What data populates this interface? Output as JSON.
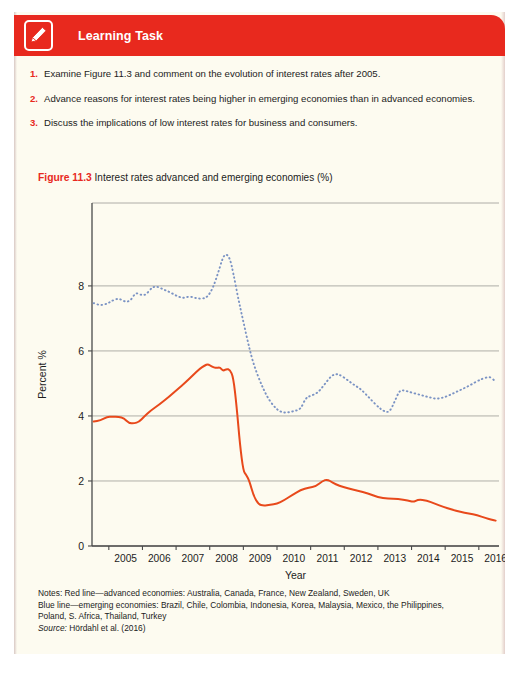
{
  "header": {
    "title": "Learning Task",
    "icon": "pencil-edit-icon",
    "accent_color": "#e8291e"
  },
  "tasks": [
    {
      "num": "1.",
      "text": "Examine Figure 11.3 and comment on the evolution of interest rates after 2005."
    },
    {
      "num": "2.",
      "text": "Advance reasons for interest rates being higher in emerging economies than in advanced economies."
    },
    {
      "num": "3.",
      "text": "Discuss the implications of low interest rates for business and consumers."
    }
  ],
  "figure": {
    "label": "Figure 11.3",
    "caption": "Interest rates advanced and emerging economies (%)"
  },
  "notes": {
    "line1": "Notes: Red line—advanced economies: Australia, Canada, France, New Zealand, Sweden, UK",
    "line2": "Blue line—emerging economies: Brazil, Chile, Colombia, Indonesia, Korea, Malaysia, Mexico, the Philippines,",
    "line3": "Poland, S. Africa, Thailand, Turkey",
    "source_label": "Source:",
    "source_text": " Hördahl et al. (2016)"
  },
  "chart_data": {
    "type": "line",
    "title": "Interest rates advanced and emerging economies (%)",
    "xlabel": "Year",
    "ylabel": "Percent %",
    "xlim": [
      2004.5,
      2016.6
    ],
    "ylim": [
      0,
      10.55
    ],
    "yticks": [
      0,
      2,
      4,
      6,
      8
    ],
    "xticks": [
      2005,
      2006,
      2007,
      2008,
      2009,
      2010,
      2011,
      2012,
      2013,
      2014,
      2015,
      2016
    ],
    "grid": "horizontal",
    "legend": "none",
    "colors": {
      "advanced": "#e8491b",
      "emerging": "#7b93c4"
    },
    "series": [
      {
        "name": "Red line—advanced economies",
        "style": "solid",
        "color": "#e8491b",
        "points": [
          [
            2004.55,
            3.83
          ],
          [
            2004.75,
            3.86
          ],
          [
            2004.95,
            3.97
          ],
          [
            2005.1,
            3.98
          ],
          [
            2005.3,
            3.97
          ],
          [
            2005.45,
            3.93
          ],
          [
            2005.6,
            3.78
          ],
          [
            2005.75,
            3.77
          ],
          [
            2005.9,
            3.82
          ],
          [
            2006.05,
            3.98
          ],
          [
            2006.25,
            4.17
          ],
          [
            2006.5,
            4.35
          ],
          [
            2006.8,
            4.6
          ],
          [
            2007.05,
            4.83
          ],
          [
            2007.3,
            5.05
          ],
          [
            2007.5,
            5.25
          ],
          [
            2007.7,
            5.45
          ],
          [
            2007.85,
            5.55
          ],
          [
            2007.95,
            5.6
          ],
          [
            2008.05,
            5.52
          ],
          [
            2008.2,
            5.47
          ],
          [
            2008.3,
            5.5
          ],
          [
            2008.4,
            5.38
          ],
          [
            2008.5,
            5.45
          ],
          [
            2008.6,
            5.42
          ],
          [
            2008.7,
            5.2
          ],
          [
            2008.8,
            4.3
          ],
          [
            2008.9,
            3.1
          ],
          [
            2009.0,
            2.3
          ],
          [
            2009.08,
            2.2
          ],
          [
            2009.18,
            2.0
          ],
          [
            2009.3,
            1.55
          ],
          [
            2009.45,
            1.28
          ],
          [
            2009.6,
            1.24
          ],
          [
            2009.8,
            1.27
          ],
          [
            2010.0,
            1.3
          ],
          [
            2010.2,
            1.4
          ],
          [
            2010.45,
            1.57
          ],
          [
            2010.7,
            1.72
          ],
          [
            2010.95,
            1.8
          ],
          [
            2011.15,
            1.83
          ],
          [
            2011.35,
            2.0
          ],
          [
            2011.5,
            2.05
          ],
          [
            2011.65,
            1.95
          ],
          [
            2011.85,
            1.85
          ],
          [
            2012.1,
            1.78
          ],
          [
            2012.4,
            1.7
          ],
          [
            2012.7,
            1.62
          ],
          [
            2013.0,
            1.5
          ],
          [
            2013.3,
            1.45
          ],
          [
            2013.6,
            1.45
          ],
          [
            2013.9,
            1.4
          ],
          [
            2014.05,
            1.35
          ],
          [
            2014.2,
            1.43
          ],
          [
            2014.45,
            1.4
          ],
          [
            2014.7,
            1.3
          ],
          [
            2014.95,
            1.2
          ],
          [
            2015.2,
            1.12
          ],
          [
            2015.45,
            1.05
          ],
          [
            2015.7,
            1.0
          ],
          [
            2015.95,
            0.95
          ],
          [
            2016.2,
            0.86
          ],
          [
            2016.4,
            0.8
          ],
          [
            2016.5,
            0.78
          ]
        ]
      },
      {
        "name": "Blue line—emerging economies",
        "style": "dotted",
        "color": "#7b93c4",
        "points": [
          [
            2004.55,
            7.47
          ],
          [
            2004.75,
            7.4
          ],
          [
            2004.95,
            7.45
          ],
          [
            2005.1,
            7.55
          ],
          [
            2005.3,
            7.62
          ],
          [
            2005.5,
            7.5
          ],
          [
            2005.65,
            7.55
          ],
          [
            2005.8,
            7.8
          ],
          [
            2005.95,
            7.72
          ],
          [
            2006.1,
            7.72
          ],
          [
            2006.25,
            7.92
          ],
          [
            2006.4,
            8.0
          ],
          [
            2006.6,
            7.9
          ],
          [
            2006.8,
            7.82
          ],
          [
            2007.0,
            7.7
          ],
          [
            2007.2,
            7.62
          ],
          [
            2007.4,
            7.68
          ],
          [
            2007.6,
            7.62
          ],
          [
            2007.8,
            7.6
          ],
          [
            2007.95,
            7.68
          ],
          [
            2008.1,
            7.95
          ],
          [
            2008.25,
            8.4
          ],
          [
            2008.38,
            8.85
          ],
          [
            2008.48,
            9.0
          ],
          [
            2008.6,
            8.85
          ],
          [
            2008.7,
            8.4
          ],
          [
            2008.85,
            7.6
          ],
          [
            2009.0,
            6.9
          ],
          [
            2009.15,
            6.2
          ],
          [
            2009.3,
            5.6
          ],
          [
            2009.5,
            5.05
          ],
          [
            2009.7,
            4.6
          ],
          [
            2009.9,
            4.3
          ],
          [
            2010.1,
            4.12
          ],
          [
            2010.3,
            4.1
          ],
          [
            2010.5,
            4.15
          ],
          [
            2010.7,
            4.2
          ],
          [
            2010.85,
            4.55
          ],
          [
            2011.0,
            4.62
          ],
          [
            2011.2,
            4.7
          ],
          [
            2011.4,
            4.95
          ],
          [
            2011.6,
            5.22
          ],
          [
            2011.75,
            5.3
          ],
          [
            2011.9,
            5.25
          ],
          [
            2012.1,
            5.1
          ],
          [
            2012.3,
            4.95
          ],
          [
            2012.5,
            4.82
          ],
          [
            2012.75,
            4.55
          ],
          [
            2013.0,
            4.28
          ],
          [
            2013.2,
            4.13
          ],
          [
            2013.35,
            4.12
          ],
          [
            2013.5,
            4.45
          ],
          [
            2013.65,
            4.8
          ],
          [
            2013.8,
            4.78
          ],
          [
            2014.0,
            4.72
          ],
          [
            2014.25,
            4.65
          ],
          [
            2014.5,
            4.58
          ],
          [
            2014.75,
            4.52
          ],
          [
            2015.0,
            4.58
          ],
          [
            2015.25,
            4.7
          ],
          [
            2015.5,
            4.82
          ],
          [
            2015.75,
            4.95
          ],
          [
            2016.0,
            5.1
          ],
          [
            2016.2,
            5.18
          ],
          [
            2016.35,
            5.2
          ],
          [
            2016.45,
            5.1
          ],
          [
            2016.5,
            5.08
          ]
        ]
      }
    ]
  }
}
